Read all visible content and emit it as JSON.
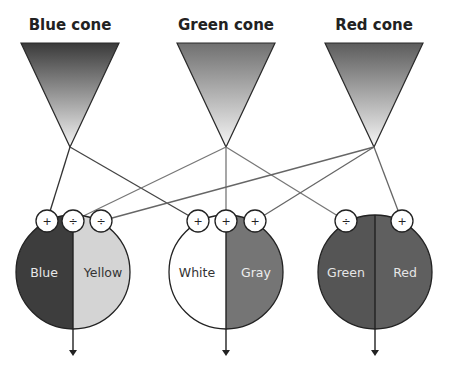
{
  "cones": [
    {
      "id": "blue",
      "title": "Blue cone",
      "cx": 70,
      "topFrom": "#3a3a3a",
      "topTo": "#f4f4f4"
    },
    {
      "id": "green",
      "title": "Green cone",
      "cx": 226,
      "topFrom": "#707070",
      "topTo": "#f6f6f6"
    },
    {
      "id": "red",
      "title": "Red cone",
      "cx": 374,
      "topFrom": "#5c5c5c",
      "topTo": "#f6f6f6"
    }
  ],
  "channels": [
    {
      "id": "blue-yellow",
      "cx": 73,
      "left": {
        "label": "Blue",
        "fill": "#3d3d3d",
        "text": "#e8e8e8"
      },
      "right": {
        "label": "Yellow",
        "fill": "#d4d4d4",
        "text": "#333333"
      }
    },
    {
      "id": "white-gray",
      "cx": 226,
      "left": {
        "label": "White",
        "fill": "#ffffff",
        "text": "#333333"
      },
      "right": {
        "label": "Gray",
        "fill": "#757575",
        "text": "#eeeeee"
      }
    },
    {
      "id": "green-red",
      "cx": 375,
      "left": {
        "label": "Green",
        "fill": "#555555",
        "text": "#e6e6e6"
      },
      "right": {
        "label": "Red",
        "fill": "#5f5f5f",
        "text": "#e6e6e6"
      }
    }
  ],
  "markers": [
    {
      "x": 47,
      "sign": "+"
    },
    {
      "x": 73,
      "sign": "÷"
    },
    {
      "x": 101,
      "sign": "÷"
    },
    {
      "x": 198,
      "sign": "+"
    },
    {
      "x": 226,
      "sign": "+"
    },
    {
      "x": 255,
      "sign": "+"
    },
    {
      "x": 346,
      "sign": "÷"
    },
    {
      "x": 402,
      "sign": "+"
    }
  ],
  "connections": [
    {
      "from": "blue",
      "to": 47,
      "color": "#333333"
    },
    {
      "from": "blue",
      "to": 198,
      "color": "#444444"
    },
    {
      "from": "green",
      "to": 73,
      "color": "#777777"
    },
    {
      "from": "green",
      "to": 226,
      "color": "#777777"
    },
    {
      "from": "green",
      "to": 346,
      "color": "#777777"
    },
    {
      "from": "red",
      "to": 101,
      "color": "#666666"
    },
    {
      "from": "red",
      "to": 255,
      "color": "#666666"
    },
    {
      "from": "red",
      "to": 402,
      "color": "#666666"
    }
  ]
}
